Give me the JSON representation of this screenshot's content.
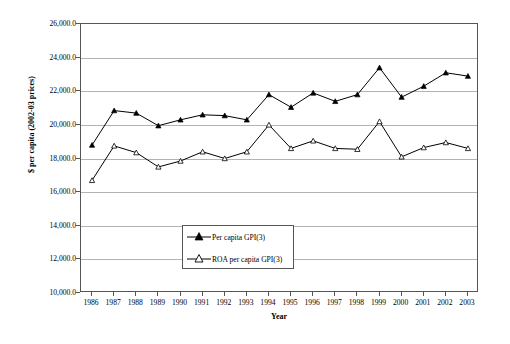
{
  "chart_data": {
    "type": "line",
    "title": "",
    "xlabel": "Year",
    "ylabel": "$ per capita (2002-03 prices)",
    "categories": [
      1986,
      1987,
      1988,
      1989,
      1990,
      1991,
      1992,
      1993,
      1994,
      1995,
      1996,
      1997,
      1998,
      1999,
      2000,
      2001,
      2002,
      2003
    ],
    "x": [
      "1986",
      "1987",
      "1988",
      "1989",
      "1990",
      "1991",
      "1992",
      "1993",
      "1994",
      "1995",
      "1996",
      "1997",
      "1998",
      "1999",
      "2000",
      "2001",
      "2002",
      "2003"
    ],
    "ylim": [
      10000,
      26000
    ],
    "xlim": [
      "1986",
      "2003"
    ],
    "y_ticks": [
      "10,000.0",
      "12,000.0",
      "14,000.0",
      "16,000.0",
      "18,000.0",
      "20,000.0",
      "22,000.0",
      "24,000.0",
      "26,000.0"
    ],
    "y_tick_values": [
      10000,
      12000,
      14000,
      16000,
      18000,
      20000,
      22000,
      24000,
      26000
    ],
    "grid": true,
    "legend_position": "inside-left",
    "series": [
      {
        "name": "Per capita GPI(3)",
        "marker": "filled-triangle",
        "values": [
          18800,
          20850,
          20700,
          19950,
          20300,
          20600,
          20550,
          20300,
          21800,
          21050,
          21900,
          21400,
          21800,
          23400,
          21650,
          22300,
          23100,
          22900
        ]
      },
      {
        "name": "ROA per capita GPI(3)",
        "marker": "open-triangle",
        "values": [
          16700,
          18750,
          18350,
          17500,
          17850,
          18400,
          18000,
          18400,
          20000,
          18600,
          19050,
          18600,
          18550,
          20200,
          18100,
          18650,
          18950,
          18600
        ]
      }
    ]
  },
  "legend": {
    "entries": [
      {
        "label": "Per capita GPI(3)"
      },
      {
        "label": "ROA per capita GPI(3)"
      }
    ]
  },
  "colors": {
    "series_stroke": "#000000",
    "grid": "#b3b3b3",
    "frame": "#555555",
    "background": "#ffffff"
  }
}
